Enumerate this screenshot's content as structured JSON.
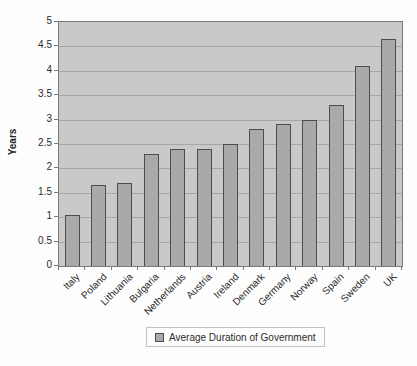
{
  "chart": {
    "ylabel": "Years",
    "legend_label": "Average Duration of Government"
  },
  "chart_data": {
    "type": "bar",
    "categories": [
      "Italy",
      "Poland",
      "Lithuania",
      "Bulgaria",
      "Netherlands",
      "Austria",
      "Ireland",
      "Denmark",
      "Germany",
      "Norway",
      "Spain",
      "Sweden",
      "UK"
    ],
    "values": [
      1.05,
      1.65,
      1.7,
      2.3,
      2.4,
      2.4,
      2.5,
      2.8,
      2.9,
      3.0,
      3.3,
      4.1,
      4.65
    ],
    "title": "",
    "xlabel": "",
    "ylabel": "Years",
    "ylim": [
      0,
      5
    ],
    "ytick_step": 0.5,
    "ytick_labels": [
      "0",
      "0.5",
      "1",
      "1.5",
      "2",
      "2.5",
      "3",
      "3.5",
      "4",
      "4.5",
      "5"
    ],
    "grid": true,
    "legend": [
      "Average Duration of Government"
    ],
    "legend_position": "bottom",
    "colors": {
      "bar_fill": "#a9a9a9",
      "bar_border": "#4d4d4d",
      "plot_bg": "#c9c9c9",
      "gridline": "#a6a6a6",
      "axis": "#7a7a7a",
      "text": "#2b2b2b",
      "legend_border": "#c2c2c2",
      "page_bg": "#fdfdfd"
    }
  }
}
